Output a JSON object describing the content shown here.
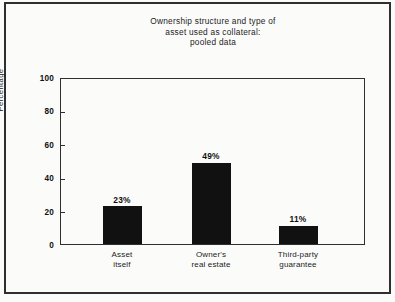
{
  "figure": {
    "background_color": "#fbfbfa",
    "border_color": "#2f2f2f",
    "bar_color": "#111111"
  },
  "chart_data": {
    "type": "bar",
    "title": "Ownership structure and type of\nasset used as collateral:\npooled data",
    "xlabel": "",
    "ylabel": "Percentage",
    "ylim": [
      0,
      100
    ],
    "yticks": [
      0,
      20,
      40,
      60,
      80,
      100
    ],
    "ytick_labels": [
      "0",
      "20",
      "40",
      "60",
      "80",
      "100"
    ],
    "grid": false,
    "legend": false,
    "legend_position": "none",
    "categories": [
      "Asset\nitself",
      "Owner's\nreal estate",
      "Third-party\nguarantee"
    ],
    "values": [
      23,
      49,
      11
    ],
    "data_labels": [
      "23%",
      "49%",
      "11%"
    ],
    "annotations": []
  }
}
